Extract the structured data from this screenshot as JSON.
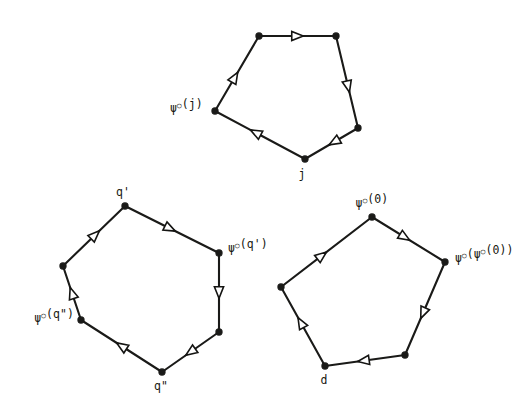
{
  "figure": {
    "background_color": "#ffffff",
    "ink_color": "#1a1a18",
    "arrowhead_fill": "#ffffff",
    "width": 527,
    "height": 416
  },
  "graphs": [
    {
      "id": "top-pentagon",
      "name": "top-pentagon-graph",
      "shape": "pentagon",
      "vertex_count": 5,
      "vertices": [
        {
          "id": "t0",
          "x": 259,
          "y": 36
        },
        {
          "id": "t1",
          "x": 336,
          "y": 36
        },
        {
          "id": "t2",
          "x": 358,
          "y": 128
        },
        {
          "id": "t3",
          "x": 305,
          "y": 159
        },
        {
          "id": "t4",
          "x": 215,
          "y": 111
        }
      ],
      "edges": [
        {
          "from": "t0",
          "to": "t1",
          "direction": "forward",
          "arrow_t": 0.5
        },
        {
          "from": "t1",
          "to": "t2",
          "direction": "forward",
          "arrow_t": 0.55
        },
        {
          "from": "t2",
          "to": "t3",
          "direction": "forward",
          "arrow_t": 0.45
        },
        {
          "from": "t3",
          "to": "t4",
          "direction": "forward",
          "arrow_t": 0.55
        },
        {
          "from": "t4",
          "to": "t0",
          "direction": "forward",
          "arrow_t": 0.45
        }
      ],
      "labels": [
        {
          "id": "top-label-psi-j",
          "name": "label-psi-circle-j",
          "text": "ψ°(j)",
          "parts": [
            {
              "t": "ψ",
              "sup": false
            },
            {
              "t": "○",
              "sup": true
            },
            {
              "t": "(j)",
              "sup": false
            }
          ],
          "vertex": "t4",
          "x": 170,
          "y": 112,
          "anchor": "start"
        },
        {
          "id": "top-label-j",
          "name": "label-j",
          "text": "j",
          "parts": [
            {
              "t": "j",
              "sup": false
            }
          ],
          "vertex": "t3",
          "x": 302,
          "y": 178,
          "anchor": "middle"
        }
      ]
    },
    {
      "id": "bottom-left-hexagon",
      "name": "bottom-left-hexagon-graph",
      "shape": "hexagon",
      "vertex_count": 6,
      "vertices": [
        {
          "id": "h0",
          "x": 125,
          "y": 206
        },
        {
          "id": "h1",
          "x": 219,
          "y": 253
        },
        {
          "id": "h2",
          "x": 219,
          "y": 332
        },
        {
          "id": "h3",
          "x": 162,
          "y": 372
        },
        {
          "id": "h4",
          "x": 81,
          "y": 320
        },
        {
          "id": "h5",
          "x": 63,
          "y": 266
        }
      ],
      "edges": [
        {
          "from": "h0",
          "to": "h1",
          "direction": "forward",
          "arrow_t": 0.48
        },
        {
          "from": "h1",
          "to": "h2",
          "direction": "forward",
          "arrow_t": 0.5
        },
        {
          "from": "h2",
          "to": "h3",
          "direction": "forward",
          "arrow_t": 0.5
        },
        {
          "from": "h3",
          "to": "h4",
          "direction": "forward",
          "arrow_t": 0.5
        },
        {
          "from": "h4",
          "to": "h5",
          "direction": "forward",
          "arrow_t": 0.5
        },
        {
          "from": "h5",
          "to": "h0",
          "direction": "forward",
          "arrow_t": 0.52
        }
      ],
      "labels": [
        {
          "id": "hex-label-q-prime",
          "name": "label-q-prime",
          "text": "q'",
          "parts": [
            {
              "t": "q'",
              "sup": false
            }
          ],
          "vertex": "h0",
          "x": 123,
          "y": 196,
          "anchor": "middle"
        },
        {
          "id": "hex-label-psi-q-prime",
          "name": "label-psi-circle-q-prime",
          "text": "ψ°(q')",
          "parts": [
            {
              "t": "ψ",
              "sup": false
            },
            {
              "t": "○",
              "sup": true
            },
            {
              "t": "(q')",
              "sup": false
            }
          ],
          "vertex": "h1",
          "x": 228,
          "y": 252,
          "anchor": "start"
        },
        {
          "id": "hex-label-psi-q-dprime",
          "name": "label-psi-circle-q-double-prime",
          "text": "ψ°(q\")",
          "parts": [
            {
              "t": "ψ",
              "sup": false
            },
            {
              "t": "○",
              "sup": true
            },
            {
              "t": "(q\")",
              "sup": false
            }
          ],
          "vertex": "h4",
          "x": 74,
          "y": 322,
          "anchor": "end"
        },
        {
          "id": "hex-label-q-dprime",
          "name": "label-q-double-prime",
          "text": "q\"",
          "parts": [
            {
              "t": "q\"",
              "sup": false
            }
          ],
          "vertex": "h3",
          "x": 161,
          "y": 390,
          "anchor": "middle"
        }
      ]
    },
    {
      "id": "bottom-right-pentagon",
      "name": "bottom-right-pentagon-graph",
      "shape": "pentagon",
      "vertex_count": 5,
      "vertices": [
        {
          "id": "p0",
          "x": 372,
          "y": 217
        },
        {
          "id": "p1",
          "x": 445,
          "y": 262
        },
        {
          "id": "p2",
          "x": 405,
          "y": 355
        },
        {
          "id": "p3",
          "x": 325,
          "y": 366
        },
        {
          "id": "p4",
          "x": 281,
          "y": 287
        }
      ],
      "edges": [
        {
          "from": "p0",
          "to": "p1",
          "direction": "forward",
          "arrow_t": 0.45
        },
        {
          "from": "p1",
          "to": "p2",
          "direction": "forward",
          "arrow_t": 0.55
        },
        {
          "from": "p2",
          "to": "p3",
          "direction": "forward",
          "arrow_t": 0.52
        },
        {
          "from": "p3",
          "to": "p4",
          "direction": "forward",
          "arrow_t": 0.55
        },
        {
          "from": "p4",
          "to": "p0",
          "direction": "forward",
          "arrow_t": 0.45
        }
      ],
      "labels": [
        {
          "id": "pent-label-psi-0",
          "name": "label-psi-circle-zero",
          "text": "ψ°(0)",
          "parts": [
            {
              "t": "ψ",
              "sup": false
            },
            {
              "t": "○",
              "sup": true
            },
            {
              "t": "(0)",
              "sup": false
            }
          ],
          "vertex": "p0",
          "x": 372,
          "y": 207,
          "anchor": "middle"
        },
        {
          "id": "pent-label-psi-psi-0",
          "name": "label-psi-circle-psi-circle-zero",
          "text": "ψ°(ψ°(0))",
          "parts": [
            {
              "t": "ψ",
              "sup": false
            },
            {
              "t": "○",
              "sup": true
            },
            {
              "t": "(",
              "sup": false
            },
            {
              "t": "ψ",
              "sup": false
            },
            {
              "t": "○",
              "sup": true
            },
            {
              "t": "(0))",
              "sup": false
            }
          ],
          "vertex": "p1",
          "x": 455,
          "y": 262,
          "anchor": "start"
        },
        {
          "id": "pent-label-d",
          "name": "label-d",
          "text": "d",
          "parts": [
            {
              "t": "d",
              "sup": false
            }
          ],
          "vertex": "p3",
          "x": 324,
          "y": 384,
          "anchor": "middle"
        }
      ]
    }
  ]
}
